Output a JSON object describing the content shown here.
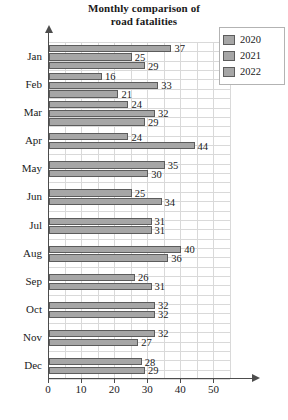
{
  "chart_data": {
    "type": "bar",
    "orientation": "horizontal",
    "title": "Monthly comparison of road fatalities",
    "title_line1": "Monthly comparison of",
    "title_line2": "road fatalities",
    "xlabel": "",
    "ylabel": "",
    "xlim": [
      0,
      55
    ],
    "xticks": [
      0,
      10,
      20,
      30,
      40,
      50
    ],
    "grid": true,
    "legend_position": "top-right",
    "categories": [
      "Jan",
      "Feb",
      "Mar",
      "Apr",
      "May",
      "Jun",
      "Jul",
      "Aug",
      "Sep",
      "Oct",
      "Nov",
      "Dec"
    ],
    "series": [
      {
        "name": "2020",
        "color": "#a6a6a6",
        "values": [
          37,
          16,
          24,
          24,
          35,
          25,
          31,
          40,
          26,
          32,
          32,
          28
        ]
      },
      {
        "name": "2021",
        "color": "#a6a6a6",
        "values": [
          25,
          33,
          32,
          44,
          30,
          34,
          31,
          36,
          31,
          32,
          27,
          29
        ]
      },
      {
        "name": "2022",
        "color": "#a6a6a6",
        "values": [
          29,
          21,
          29,
          24,
          30,
          34,
          31,
          36,
          31,
          32,
          27,
          29
        ]
      }
    ],
    "bar_labels": {
      "Jan": [
        37,
        25,
        29
      ],
      "Feb": [
        16,
        33,
        21
      ],
      "Mar": [
        24,
        32,
        29
      ],
      "Apr": [
        24,
        44
      ],
      "May": [
        35,
        30
      ],
      "Jun": [
        25,
        34
      ],
      "Jul": [
        31,
        31
      ],
      "Aug": [
        40,
        36
      ],
      "Sep": [
        26,
        31
      ],
      "Oct": [
        32,
        32
      ],
      "Nov": [
        32,
        27
      ],
      "Dec": [
        28,
        29
      ]
    }
  },
  "legend": {
    "items": [
      {
        "label": "2020",
        "color": "#a6a6a6"
      },
      {
        "label": "2021",
        "color": "#a6a6a6"
      },
      {
        "label": "2022",
        "color": "#a6a6a6"
      }
    ]
  }
}
